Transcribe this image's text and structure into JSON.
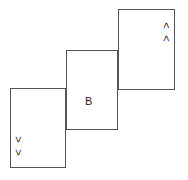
{
  "diagram": {
    "stroke_color": "#555555",
    "background_color": "#ffffff",
    "text_color": "#1a1a1a",
    "boxes": [
      {
        "name": "top-right-box",
        "x": 118,
        "y": 9,
        "width": 57,
        "height": 81,
        "labels": [
          ">",
          ">"
        ],
        "label_orientation": "vertical"
      },
      {
        "name": "middle-box",
        "x": 66,
        "y": 50,
        "width": 52,
        "height": 80,
        "labels": [
          "B"
        ],
        "label_orientation": "horizontal"
      },
      {
        "name": "bottom-left-box",
        "x": 10,
        "y": 88,
        "width": 56,
        "height": 80,
        "labels": [
          "<",
          "<"
        ],
        "label_orientation": "vertical"
      }
    ],
    "top_right_labels": {
      "first": ">",
      "second": ">"
    },
    "center_label": "B",
    "bottom_left_labels": {
      "first": "<",
      "second": "<"
    }
  }
}
